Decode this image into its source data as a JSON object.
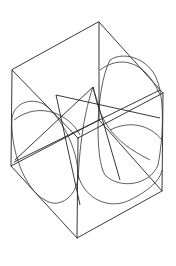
{
  "figure": {
    "stroke_color": "#222222",
    "background": "#ffffff",
    "vertices": {
      "top": [
        99,
        22
      ],
      "left_top": [
        12,
        70
      ],
      "right": [
        163,
        93
      ],
      "center_front": [
        78,
        138
      ],
      "left_bottom": [
        11,
        166
      ],
      "right_bottom": [
        162,
        191
      ],
      "bottom": [
        77,
        238
      ],
      "back_bottom": [
        99,
        120
      ]
    }
  }
}
